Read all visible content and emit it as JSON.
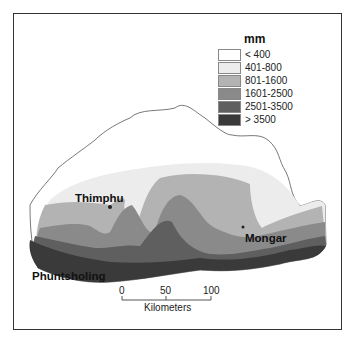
{
  "map": {
    "unit_title": "mm",
    "legend": [
      {
        "label": "< 400",
        "color": "#ffffff"
      },
      {
        "label": "401-800",
        "color": "#ececec"
      },
      {
        "label": "801-1600",
        "color": "#b3b3b3"
      },
      {
        "label": "1601-2500",
        "color": "#8a8a8a"
      },
      {
        "label": "2501-3500",
        "color": "#5f5f5f"
      },
      {
        "label": "> 3500",
        "color": "#3a3a3a"
      }
    ],
    "cities": [
      {
        "name": "Thimphu"
      },
      {
        "name": "Mongar"
      },
      {
        "name": "Phuntsholing"
      }
    ],
    "scale": {
      "ticks": [
        "0",
        "50",
        "100"
      ],
      "unit": "Kilometers"
    }
  }
}
